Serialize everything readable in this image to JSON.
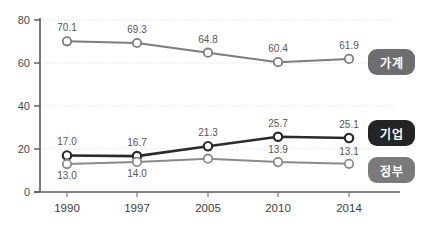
{
  "chart_data": {
    "type": "line",
    "title": "",
    "xlabel": "",
    "ylabel": "",
    "categories": [
      "1990",
      "1997",
      "2005",
      "2010",
      "2014"
    ],
    "ylim": [
      0,
      80
    ],
    "yticks": [
      "0",
      "20",
      "40",
      "60",
      "80"
    ],
    "grid": true,
    "legend_position": "right",
    "series": [
      {
        "name": "가계",
        "color": "#7d7d7d",
        "label_color": "#808080",
        "badge_color": "#6e6e6e",
        "values": [
          70.1,
          69.3,
          64.8,
          60.4,
          61.9
        ],
        "labels": [
          "70.1",
          "69.3",
          "64.8",
          "60.4",
          "61.9"
        ]
      },
      {
        "name": "기업",
        "color": "#2b2b2b",
        "label_color": "#3a3a3a",
        "badge_color": "#242424",
        "values": [
          17.0,
          16.7,
          21.3,
          25.7,
          25.1
        ],
        "labels": [
          "17.0",
          "16.7",
          "21.3",
          "25.7",
          "25.1"
        ]
      },
      {
        "name": "정부",
        "color": "#8a8a8a",
        "label_color": "#6d6d6d",
        "badge_color": "#7a7a7a",
        "values": [
          13.0,
          14.0,
          15.5,
          13.9,
          13.1
        ],
        "labels": [
          "13.0",
          "14.0",
          "",
          "13.9",
          "13.1"
        ]
      }
    ]
  },
  "legend": {
    "items": [
      {
        "label": "가계"
      },
      {
        "label": "기업"
      },
      {
        "label": "정부"
      }
    ]
  },
  "axes": {
    "y_ticks": [
      "80",
      "60",
      "40",
      "20",
      "0"
    ],
    "x_ticks": [
      "1990",
      "1997",
      "2005",
      "2010",
      "2014"
    ]
  }
}
